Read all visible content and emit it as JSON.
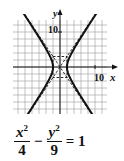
{
  "chart_data": {
    "type": "line",
    "title": "",
    "equation": {
      "term1_num": "x",
      "term1_exp": "2",
      "term1_den": "4",
      "minus": "−",
      "term2_num": "y",
      "term2_exp": "2",
      "term2_den": "9",
      "equals": "= 1"
    },
    "xlabel": "x",
    "ylabel": "y",
    "x_tick_label": "10",
    "y_tick_label": "10",
    "xlim": [
      -14,
      14
    ],
    "ylim": [
      -14,
      14
    ],
    "grid": true,
    "grid_step": 2,
    "series": [
      {
        "name": "hyperbola right branch",
        "style": "solid",
        "a": 2,
        "b": 3,
        "branch": "right"
      },
      {
        "name": "hyperbola left branch",
        "style": "solid",
        "a": 2,
        "b": 3,
        "branch": "left"
      },
      {
        "name": "asymptote y = 3x/2",
        "style": "dashed",
        "slope": 1.5
      },
      {
        "name": "asymptote y = -3x/2",
        "style": "dashed",
        "slope": -1.5
      },
      {
        "name": "fundamental rectangle",
        "style": "dashed",
        "x": [
          -2,
          2
        ],
        "y": [
          -3,
          3
        ]
      }
    ]
  },
  "colors": {
    "ink": "#111111",
    "grid": "#9a9a9a"
  }
}
